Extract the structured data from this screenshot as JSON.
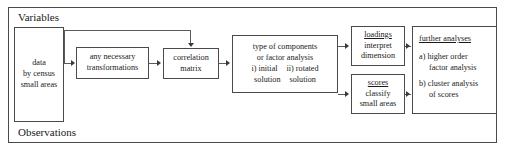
{
  "diagram": {
    "frame": {
      "top_label": "Variables",
      "bottom_label": "Observations"
    },
    "nodes": {
      "data": {
        "lines": [
          "data",
          "by census",
          "small areas"
        ]
      },
      "transformations": {
        "lines": [
          "any necessary",
          "transformations"
        ]
      },
      "correlation_matrix": {
        "lines": [
          "correlation",
          "matrix"
        ]
      },
      "analysis": {
        "line1": "type of components",
        "line2": "or factor analysis",
        "col1_line1": "i) initial",
        "col1_line2": "solution",
        "col2_line1": "ii) rotated",
        "col2_line2": "solution"
      },
      "loadings": {
        "heading": "loadings",
        "lines": [
          "interpret",
          "dimension"
        ]
      },
      "scores": {
        "heading": "scores",
        "lines": [
          "classify",
          "small areas"
        ]
      },
      "further_analyses": {
        "heading": "further analyses",
        "item_a_line1": "a) higher order",
        "item_a_line2": "factor analysis",
        "item_b_line1": "b) cluster analysis",
        "item_b_line2": "of scores"
      }
    },
    "colors": {
      "border": "#4a4a4a",
      "connector": "#5a5a5a",
      "text": "#1a1a1a",
      "background": "#ffffff"
    }
  }
}
